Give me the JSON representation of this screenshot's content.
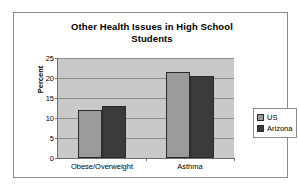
{
  "chart_data": {
    "type": "bar",
    "title": "Other Health Issues in High School Students",
    "title_line1": "Other Health Issues in High School",
    "title_line2": "Students",
    "xlabel": "",
    "ylabel": "Percent",
    "categories": [
      "Obese/Overweight",
      "Asthma"
    ],
    "series": [
      {
        "name": "US",
        "values": [
          12,
          21.5
        ],
        "color": "#9b9b9b"
      },
      {
        "name": "Arizona",
        "values": [
          13,
          20.5
        ],
        "color": "#3b3b3b"
      }
    ],
    "ylim": [
      0,
      25
    ],
    "ytick_labels": [
      "0",
      "5",
      "10",
      "15",
      "20",
      "25"
    ],
    "ytick_values": [
      0,
      5,
      10,
      15,
      20,
      25
    ],
    "grid": true,
    "legend_position": "right",
    "plot_background": "#c9c9c9",
    "frame_color": "#8a8a8a"
  },
  "legend": {
    "items": [
      {
        "label": "US",
        "swatch": "series-us"
      },
      {
        "label": "Arizona",
        "swatch": "series-az"
      }
    ]
  }
}
